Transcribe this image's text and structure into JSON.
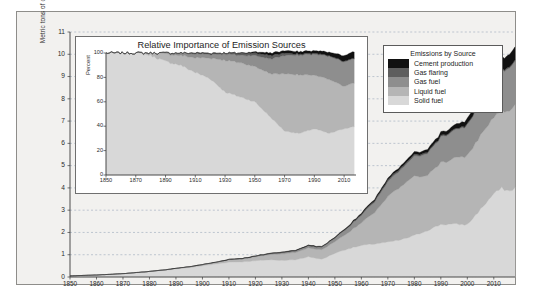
{
  "figure": {
    "background": "#f2f1ef",
    "frame_border": "#8e8d8a"
  },
  "main": {
    "ylabel": "Metric tons of carbon (billions)",
    "yticks": [
      0,
      1,
      2,
      3,
      4,
      5,
      6,
      7,
      8,
      9,
      10,
      11
    ],
    "xticks": [
      1850,
      1860,
      1870,
      1880,
      1890,
      1900,
      1910,
      1920,
      1930,
      1940,
      1950,
      1960,
      1970,
      1980,
      1990,
      2000,
      2010
    ],
    "xlim": [
      1850,
      2018
    ],
    "ylim": [
      0,
      11
    ],
    "grid": "dashed-horizontal"
  },
  "legend": {
    "title": "Emissions by Source",
    "items": [
      {
        "label": "Cement production",
        "color": "#111111"
      },
      {
        "label": "Gas flaring",
        "color": "#5e5e5e"
      },
      {
        "label": "Gas fuel",
        "color": "#8e8e8e"
      },
      {
        "label": "Liquid fuel",
        "color": "#b5b5b5"
      },
      {
        "label": "Solid fuel",
        "color": "#d8d8d8"
      }
    ]
  },
  "inset": {
    "title": "Relative Importance of Emission Sources",
    "ylabel": "Percent",
    "yticks": [
      0,
      20,
      40,
      60,
      80,
      100
    ],
    "xticks": [
      1850,
      1870,
      1890,
      1910,
      1930,
      1950,
      1970,
      1990,
      2010
    ],
    "xlim": [
      1850,
      2018
    ],
    "ylim": [
      0,
      100
    ]
  },
  "chart_data": {
    "type": "area",
    "xlabel": "",
    "ylabel": "Metric tons of carbon (billions)",
    "xlim": [
      1850,
      2018
    ],
    "ylim": [
      0,
      11
    ],
    "stack_order_bottom_to_top": [
      "Solid fuel",
      "Liquid fuel",
      "Gas fuel",
      "Gas flaring",
      "Cement production"
    ],
    "x": [
      1850,
      1855,
      1860,
      1865,
      1870,
      1875,
      1880,
      1885,
      1890,
      1895,
      1900,
      1905,
      1910,
      1915,
      1920,
      1925,
      1930,
      1935,
      1940,
      1945,
      1950,
      1955,
      1960,
      1965,
      1970,
      1975,
      1980,
      1985,
      1990,
      1995,
      2000,
      2005,
      2010,
      2013,
      2016,
      2018
    ],
    "series": [
      {
        "name": "Solid fuel",
        "color": "#d8d8d8",
        "values": [
          0.05,
          0.07,
          0.09,
          0.12,
          0.15,
          0.19,
          0.24,
          0.29,
          0.36,
          0.42,
          0.5,
          0.58,
          0.67,
          0.68,
          0.73,
          0.77,
          0.75,
          0.77,
          0.91,
          0.79,
          1.07,
          1.27,
          1.41,
          1.49,
          1.56,
          1.67,
          1.86,
          2.1,
          2.36,
          2.37,
          2.35,
          3.04,
          3.74,
          3.98,
          3.85,
          4.0
        ]
      },
      {
        "name": "Liquid fuel",
        "color": "#b5b5b5",
        "values": [
          0.0,
          0.0,
          0.0,
          0.0,
          0.0,
          0.01,
          0.01,
          0.02,
          0.03,
          0.04,
          0.05,
          0.07,
          0.1,
          0.13,
          0.17,
          0.23,
          0.29,
          0.33,
          0.39,
          0.43,
          0.52,
          0.72,
          1.02,
          1.42,
          2.05,
          2.38,
          2.67,
          2.49,
          2.77,
          2.94,
          3.09,
          3.34,
          3.43,
          3.52,
          3.64,
          3.7
        ]
      },
      {
        "name": "Gas fuel",
        "color": "#8e8e8e",
        "values": [
          0.0,
          0.0,
          0.0,
          0.0,
          0.0,
          0.0,
          0.0,
          0.0,
          0.0,
          0.0,
          0.01,
          0.01,
          0.02,
          0.02,
          0.03,
          0.04,
          0.06,
          0.07,
          0.09,
          0.11,
          0.16,
          0.23,
          0.34,
          0.47,
          0.66,
          0.77,
          0.89,
          0.99,
          1.14,
          1.24,
          1.35,
          1.5,
          1.71,
          1.8,
          1.9,
          1.98
        ]
      },
      {
        "name": "Gas flaring",
        "color": "#5e5e5e",
        "values": [
          0.0,
          0.0,
          0.0,
          0.0,
          0.0,
          0.0,
          0.0,
          0.0,
          0.0,
          0.0,
          0.0,
          0.0,
          0.002,
          0.003,
          0.005,
          0.008,
          0.012,
          0.014,
          0.018,
          0.02,
          0.023,
          0.035,
          0.052,
          0.07,
          0.08,
          0.085,
          0.08,
          0.06,
          0.055,
          0.05,
          0.048,
          0.055,
          0.06,
          0.062,
          0.06,
          0.06
        ]
      },
      {
        "name": "Cement production",
        "color": "#111111",
        "values": [
          0.0,
          0.0,
          0.0,
          0.0,
          0.0,
          0.0,
          0.0,
          0.0,
          0.001,
          0.001,
          0.002,
          0.003,
          0.005,
          0.005,
          0.007,
          0.011,
          0.014,
          0.015,
          0.018,
          0.016,
          0.022,
          0.033,
          0.045,
          0.059,
          0.076,
          0.09,
          0.11,
          0.125,
          0.15,
          0.18,
          0.23,
          0.32,
          0.43,
          0.52,
          0.56,
          0.58
        ]
      }
    ]
  },
  "inset_data": {
    "type": "area",
    "title": "Relative Importance of Emission Sources",
    "ylabel": "Percent",
    "ylim": [
      0,
      100
    ],
    "xlim": [
      1850,
      2018
    ],
    "stack_order_bottom_to_top": [
      "Solid fuel",
      "Liquid fuel",
      "Gas fuel",
      "Gas flaring",
      "Cement production"
    ],
    "x": [
      1850,
      1860,
      1870,
      1880,
      1890,
      1900,
      1910,
      1920,
      1930,
      1940,
      1950,
      1960,
      1970,
      1980,
      1990,
      2000,
      2010,
      2018
    ],
    "series": [
      {
        "name": "Solid fuel",
        "color": "#d8d8d8",
        "values": [
          100,
          100,
          100,
          98,
          93,
          90,
          84,
          79,
          68,
          64,
          60,
          48,
          36,
          34,
          38,
          34,
          38,
          40
        ]
      },
      {
        "name": "Liquid fuel",
        "color": "#b5b5b5",
        "values": [
          0,
          0,
          0,
          2,
          6,
          8,
          12,
          17,
          26,
          28,
          29,
          35,
          47,
          48,
          44,
          44,
          35,
          36
        ]
      },
      {
        "name": "Gas fuel",
        "color": "#8e8e8e",
        "values": [
          0,
          0,
          0,
          0,
          1,
          2,
          3,
          3,
          5,
          6,
          9,
          12,
          15,
          16,
          17,
          19,
          20,
          20
        ]
      },
      {
        "name": "Gas flaring",
        "color": "#5e5e5e",
        "values": [
          0,
          0,
          0,
          0,
          0,
          0,
          1,
          1,
          1,
          2,
          2,
          3,
          2,
          1,
          1,
          0.7,
          0.6,
          0.6
        ]
      },
      {
        "name": "Cement production",
        "color": "#111111",
        "values": [
          0,
          0,
          0,
          0,
          0,
          0,
          0,
          0,
          0,
          0,
          1,
          2,
          2,
          2,
          2,
          2.8,
          4.5,
          5.5
        ]
      }
    ]
  }
}
